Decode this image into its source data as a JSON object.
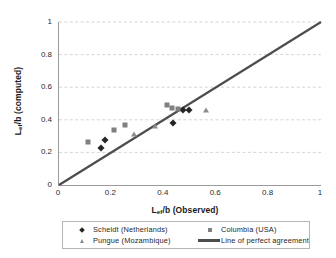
{
  "chart_data": {
    "type": "scatter",
    "title": "",
    "xlabel": "Lef/b (Observed)",
    "ylabel": "Lef/b (computed)",
    "xlabel_main": "/b (Observed)",
    "xlabel_lead": "L",
    "xlabel_sub": "ef",
    "ylabel_lead": "L",
    "ylabel_sub": "ef",
    "ylabel_main": "/b (computed)",
    "xlim": [
      0,
      1
    ],
    "ylim": [
      0,
      1
    ],
    "xticks": [
      "0",
      "0.2",
      "0.4",
      "0.6",
      "0.8",
      "1"
    ],
    "yticks": [
      "0",
      "0.2",
      "0.4",
      "0.6",
      "0.8",
      "1"
    ],
    "xtick_values": [
      0,
      0.2,
      0.4,
      0.6,
      0.8,
      1
    ],
    "ytick_values": [
      0,
      0.2,
      0.4,
      0.6,
      0.8,
      1
    ],
    "grid": "horizontal-dashed",
    "legend_position": "below-plot",
    "series": [
      {
        "name": "Scheldt (Netherlands)",
        "marker": "diamond",
        "color": "#262626",
        "points": [
          [
            0.16,
            0.23
          ],
          [
            0.176,
            0.275
          ],
          [
            0.435,
            0.383
          ],
          [
            0.475,
            0.458
          ],
          [
            0.496,
            0.463
          ]
        ]
      },
      {
        "name": "Columbia (USA)",
        "marker": "square",
        "color": "#808080",
        "points": [
          [
            0.11,
            0.265
          ],
          [
            0.21,
            0.335
          ],
          [
            0.25,
            0.37
          ],
          [
            0.412,
            0.49
          ],
          [
            0.432,
            0.47
          ],
          [
            0.455,
            0.465
          ]
        ]
      },
      {
        "name": "Pungue (Mozambique)",
        "marker": "triangle",
        "color": "#8c8c8c",
        "points": [
          [
            0.285,
            0.315
          ],
          [
            0.365,
            0.365
          ],
          [
            0.56,
            0.462
          ]
        ]
      }
    ],
    "reference_line": {
      "name": "Line of perfect agreement",
      "color": "#4d4d4d",
      "from": [
        0,
        0
      ],
      "to": [
        1,
        1
      ]
    }
  },
  "legend": {
    "items": [
      {
        "label": "Scheldt (Netherlands)",
        "marker": "diamond-icon"
      },
      {
        "label": "Columbia (USA)",
        "marker": "square-icon"
      },
      {
        "label": "Pungue (Mozambique)",
        "marker": "triangle-icon"
      },
      {
        "label": "Line of perfect agreement",
        "marker": "line-icon"
      }
    ]
  }
}
